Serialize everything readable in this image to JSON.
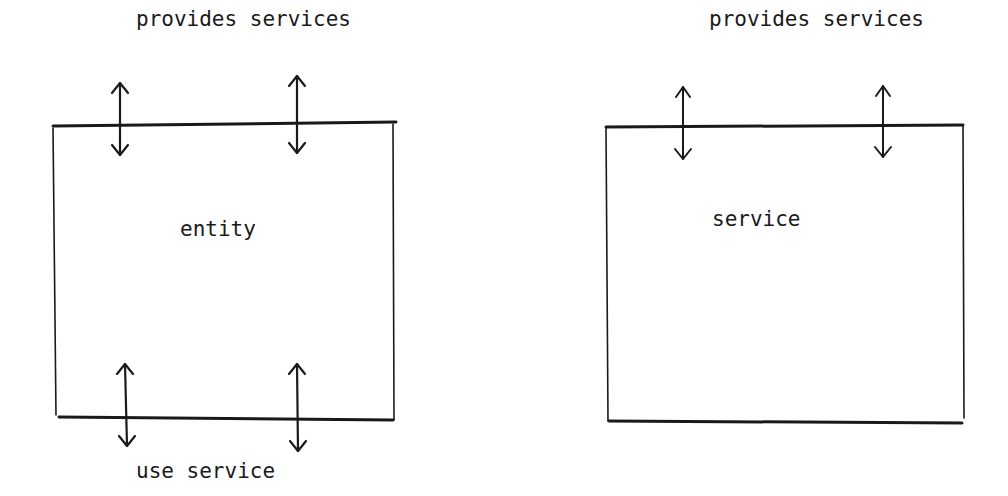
{
  "diagram": {
    "left": {
      "box_label": "entity",
      "top_label": "provides services",
      "bottom_label": "use service",
      "top_arrows": 2,
      "bottom_arrows": 2
    },
    "right": {
      "box_label": "service",
      "top_label": "provides services",
      "top_arrows": 2,
      "bottom_arrows": 0
    }
  }
}
